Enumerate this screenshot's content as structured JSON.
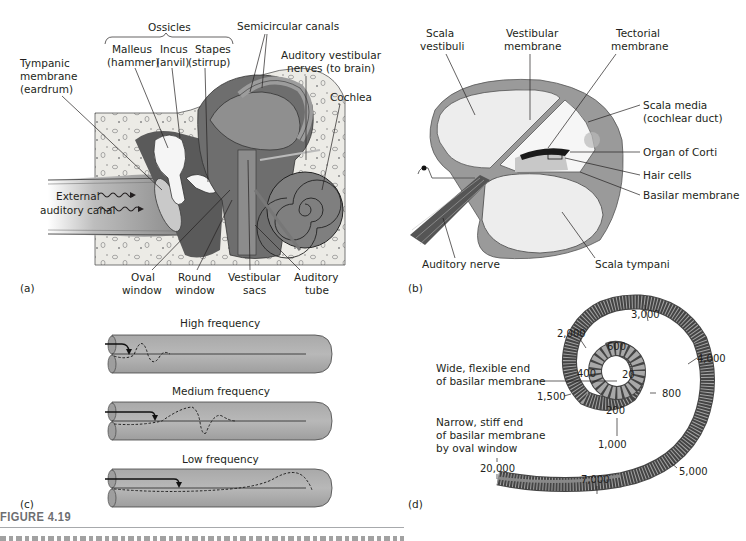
{
  "figure": {
    "title": "FIGURE 4.19",
    "caption_visible": "clipped"
  },
  "panel_a": {
    "letter": "(a)",
    "labels": {
      "ossicles": "Ossicles",
      "malleus_1": "Malleus",
      "malleus_2": "(hammer)",
      "incus_1": "Incus",
      "incus_2": "(anvil)",
      "stapes_1": "Stapes",
      "stapes_2": "(stirrup)",
      "semicircular": "Semicircular canals",
      "tympanic_1": "Tympanic",
      "tympanic_2": "membrane",
      "tympanic_3": "(eardrum)",
      "avn_1": "Auditory vestibular",
      "avn_2": "nerves (to brain)",
      "cochlea": "Cochlea",
      "external_1": "External",
      "external_2": "auditory canal",
      "oval_1": "Oval",
      "oval_2": "window",
      "round_1": "Round",
      "round_2": "window",
      "vest_1": "Vestibular",
      "vest_2": "sacs",
      "tube_1": "Auditory",
      "tube_2": "tube"
    }
  },
  "panel_b": {
    "letter": "(b)",
    "labels": {
      "sv_1": "Scala",
      "sv_2": "vestibuli",
      "vm_1": "Vestibular",
      "vm_2": "membrane",
      "tm_1": "Tectorial",
      "tm_2": "membrane",
      "sm_1": "Scala media",
      "sm_2": "(cochlear duct)",
      "corti": "Organ of Corti",
      "hair": "Hair cells",
      "basilar": "Basilar membrane",
      "nerve": "Auditory nerve",
      "st": "Scala tympani"
    }
  },
  "panel_c": {
    "letter": "(c)",
    "rows": [
      {
        "label": "High frequency"
      },
      {
        "label": "Medium frequency"
      },
      {
        "label": "Low frequency"
      }
    ]
  },
  "panel_d": {
    "letter": "(d)",
    "wide_1": "Wide, flexible end",
    "wide_2": "of basilar membrane",
    "narrow_1": "Narrow, stiff end",
    "narrow_2": "of basilar membrane",
    "narrow_3": "by oval window",
    "frequencies": {
      "f20": "20",
      "f200": "200",
      "f400": "400",
      "f600": "600",
      "f800": "800",
      "f1000": "1,000",
      "f1500": "1,500",
      "f2000": "2,000",
      "f3000": "3,000",
      "f4000": "4,000",
      "f5000": "5,000",
      "f7000": "7,000",
      "f20000": "20,000"
    }
  }
}
